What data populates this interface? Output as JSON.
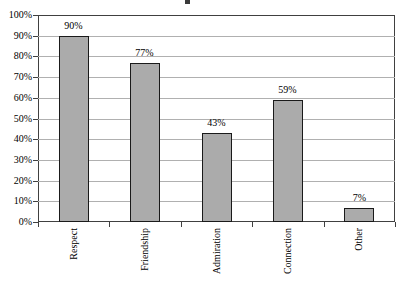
{
  "chart_data": {
    "type": "bar",
    "categories": [
      "Respect",
      "Friendship",
      "Admiration",
      "Connection",
      "Other"
    ],
    "values": [
      90,
      77,
      43,
      59,
      7
    ],
    "data_labels": [
      "90%",
      "77%",
      "43%",
      "59%",
      "7%"
    ],
    "title": "",
    "xlabel": "",
    "ylabel": "",
    "ylim": [
      0,
      100
    ],
    "ytick_step": 10,
    "ytick_labels": [
      "0%",
      "10%",
      "20%",
      "30%",
      "40%",
      "50%",
      "60%",
      "70%",
      "80%",
      "90%",
      "100%"
    ],
    "grid": true,
    "legend_position": "none",
    "colors": {
      "bar_fill": "#ababab",
      "bar_border": "#1a1a1a",
      "gridline": "#b0b0b0",
      "axis": "#404040",
      "text": "#000000",
      "background": "#ffffff"
    }
  }
}
